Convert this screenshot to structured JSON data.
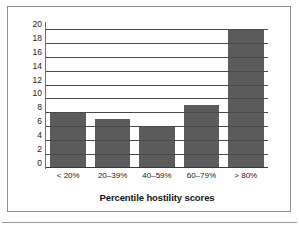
{
  "chart_data": {
    "type": "bar",
    "title": "",
    "subtitle": "",
    "xlabel": "Percentile hostility scores",
    "ylabel": "Episodes of Incident CHD",
    "categories": [
      "< 20%",
      "20–39%",
      "40–59%",
      "60–79%",
      "> 80%"
    ],
    "values": [
      8,
      7,
      6,
      9,
      20
    ],
    "ylim": [
      0,
      21
    ],
    "yticks": [
      0,
      2,
      4,
      6,
      8,
      10,
      12,
      14,
      16,
      18,
      20
    ],
    "ytick_labels": [
      "0",
      "2",
      "4",
      "6",
      "8",
      "10",
      "12",
      "14",
      "16",
      "18",
      "20"
    ],
    "grid": true,
    "grid_axis": "y",
    "legend": false,
    "legend_position": "none",
    "bar_color": "#5b5b5b",
    "gridline_color": "#4a4a4a",
    "axis_color": "#3a3a3a",
    "text_color": "#141414",
    "background_color": "#ffffff",
    "frame_border_color": "#8e8e8e"
  }
}
